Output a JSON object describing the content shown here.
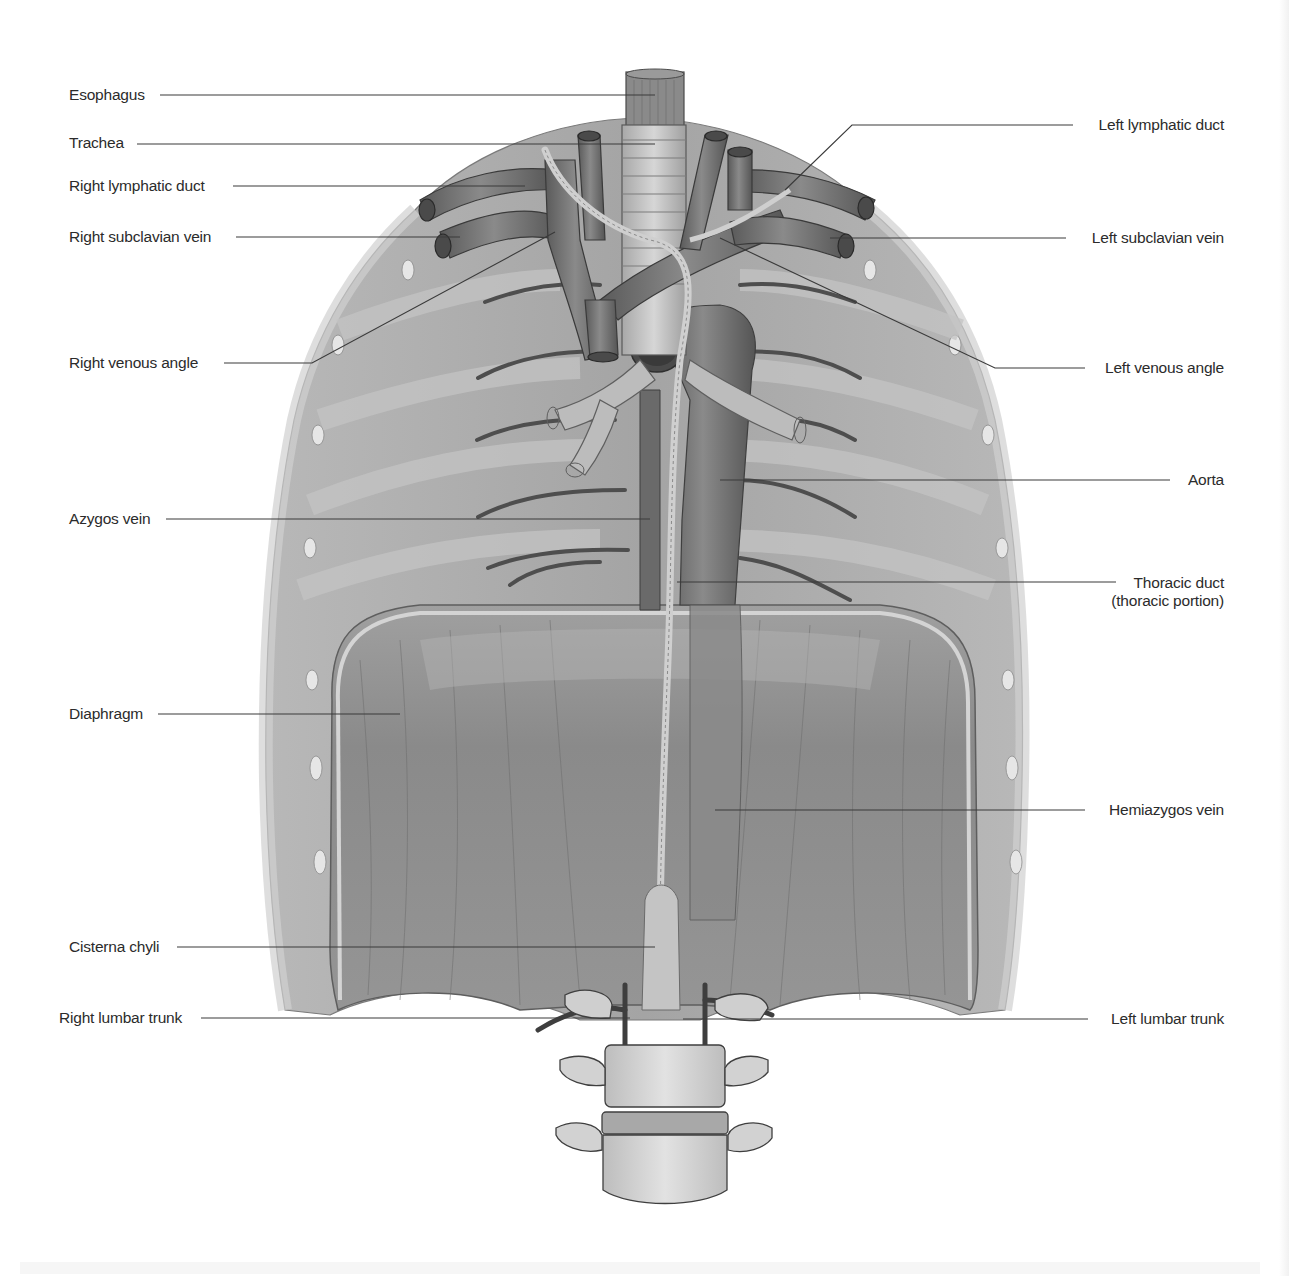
{
  "figure": {
    "colors": {
      "background": "#ffffff",
      "text": "#2b2b2b",
      "leader_line": "#3a3a3a",
      "ribcage_fill": "#a9a9a9",
      "rib_light": "#c8c8c8",
      "diaphragm_fill": "#8f8f8f",
      "vessel_dark": "#6c6c6c",
      "duct_light": "#c9c9c9",
      "bone_light": "#d6d6d6"
    }
  },
  "labels": {
    "left": [
      {
        "id": "esophagus",
        "text": "Esophagus",
        "x": 69,
        "y": 86,
        "line": [
          [
            160,
            95
          ],
          [
            655,
            95
          ]
        ]
      },
      {
        "id": "trachea",
        "text": "Trachea",
        "x": 69,
        "y": 134,
        "line": [
          [
            137,
            144
          ],
          [
            655,
            144
          ]
        ]
      },
      {
        "id": "right-lymphatic-duct",
        "text": "Right lymphatic duct",
        "x": 69,
        "y": 177,
        "line": [
          [
            233,
            186
          ],
          [
            525,
            186
          ]
        ]
      },
      {
        "id": "right-subclavian-vein",
        "text": "Right subclavian vein",
        "x": 69,
        "y": 228,
        "line": [
          [
            236,
            237
          ],
          [
            460,
            237
          ]
        ]
      },
      {
        "id": "right-venous-angle",
        "text": "Right venous angle",
        "x": 69,
        "y": 354,
        "line": [
          [
            224,
            363
          ],
          [
            312,
            363
          ],
          [
            555,
            232
          ]
        ]
      },
      {
        "id": "azygos-vein",
        "text": "Azygos vein",
        "x": 69,
        "y": 510,
        "line": [
          [
            166,
            519
          ],
          [
            650,
            519
          ]
        ]
      },
      {
        "id": "diaphragm",
        "text": "Diaphragm",
        "x": 69,
        "y": 705,
        "line": [
          [
            158,
            714
          ],
          [
            400,
            714
          ]
        ]
      },
      {
        "id": "cisterna-chyli",
        "text": "Cisterna chyli",
        "x": 69,
        "y": 938,
        "line": [
          [
            177,
            947
          ],
          [
            655,
            947
          ]
        ]
      },
      {
        "id": "right-lumbar-trunk",
        "text": "Right lumbar trunk",
        "x": 59,
        "y": 1009,
        "line": [
          [
            201,
            1018
          ],
          [
            630,
            1018
          ]
        ]
      }
    ],
    "right": [
      {
        "id": "left-lymphatic-duct",
        "text": "Left lymphatic duct",
        "x": 1224,
        "y": 116,
        "line": [
          [
            1073,
            125
          ],
          [
            852,
            125
          ],
          [
            785,
            190
          ]
        ]
      },
      {
        "id": "left-subclavian-vein",
        "text": "Left subclavian vein",
        "x": 1224,
        "y": 229,
        "line": [
          [
            1066,
            238
          ],
          [
            830,
            238
          ]
        ]
      },
      {
        "id": "left-venous-angle",
        "text": "Left venous angle",
        "x": 1224,
        "y": 359,
        "line": [
          [
            1085,
            368
          ],
          [
            995,
            368
          ],
          [
            720,
            238
          ]
        ]
      },
      {
        "id": "aorta",
        "text": "Aorta",
        "x": 1224,
        "y": 471,
        "line": [
          [
            1170,
            480
          ],
          [
            720,
            480
          ]
        ]
      },
      {
        "id": "thoracic-duct",
        "text": "Thoracic duct",
        "text2": "(thoracic portion)",
        "x": 1224,
        "y": 574,
        "line": [
          [
            1116,
            582
          ],
          [
            677,
            582
          ]
        ]
      },
      {
        "id": "hemiazygos-vein",
        "text": "Hemiazygos vein",
        "x": 1224,
        "y": 801,
        "line": [
          [
            1085,
            810
          ],
          [
            715,
            810
          ]
        ]
      },
      {
        "id": "left-lumbar-trunk",
        "text": "Left lumbar trunk",
        "x": 1224,
        "y": 1010,
        "line": [
          [
            1088,
            1019
          ],
          [
            683,
            1019
          ]
        ]
      }
    ]
  }
}
